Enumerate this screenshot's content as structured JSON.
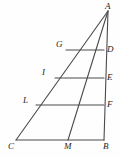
{
  "figure": {
    "kind": "geometry-diagram",
    "canvas": {
      "width": 121,
      "height": 158
    },
    "stroke_color": "#4a4a4a",
    "label_color": "#1d1d1d",
    "background_color": "#fefefe",
    "stroke_width": 1.1,
    "points": [
      {
        "id": "A",
        "label": "A",
        "x": 108,
        "y": 11,
        "label_x": 105,
        "label_y": 2,
        "role": "apex-vertex"
      },
      {
        "id": "B",
        "label": "B",
        "x": 104,
        "y": 140,
        "label_x": 103,
        "label_y": 142,
        "role": "base-right-vertex"
      },
      {
        "id": "C",
        "label": "C",
        "x": 16,
        "y": 140,
        "label_x": 8,
        "label_y": 142,
        "role": "base-left-vertex"
      },
      {
        "id": "M",
        "label": "M",
        "x": 68,
        "y": 140,
        "label_x": 64,
        "label_y": 142,
        "role": "base-point"
      },
      {
        "id": "D",
        "label": "D",
        "x": 104,
        "y": 50,
        "label_x": 107,
        "label_y": 45,
        "role": "right-edge-point"
      },
      {
        "id": "E",
        "label": "E",
        "x": 104,
        "y": 78,
        "label_x": 107,
        "label_y": 73,
        "role": "right-edge-point"
      },
      {
        "id": "F",
        "label": "F",
        "x": 104,
        "y": 105,
        "label_x": 107,
        "label_y": 100,
        "role": "right-edge-point"
      },
      {
        "id": "G",
        "label": "G",
        "x": 66,
        "y": 50,
        "label_x": 56,
        "label_y": 40,
        "role": "hypotenuse-point"
      },
      {
        "id": "I",
        "label": "I",
        "x": 55,
        "y": 78,
        "label_x": 42,
        "label_y": 68,
        "role": "hypotenuse-point"
      },
      {
        "id": "L",
        "label": "L",
        "x": 36,
        "y": 105,
        "label_x": 23,
        "label_y": 96,
        "role": "hypotenuse-point"
      }
    ],
    "segments": [
      {
        "id": "AB",
        "name": "segment-a-b",
        "from": "A",
        "to": "B"
      },
      {
        "id": "CB",
        "name": "segment-c-b",
        "from": "C",
        "to": "B"
      },
      {
        "id": "CA",
        "name": "segment-c-a",
        "from": "C",
        "to": "A"
      },
      {
        "id": "AM",
        "name": "cevian-a-m",
        "from": "A",
        "to": "M"
      },
      {
        "id": "GD",
        "name": "segment-g-d",
        "from": "G",
        "to": "D"
      },
      {
        "id": "IE",
        "name": "segment-i-e",
        "from": "I",
        "to": "E"
      },
      {
        "id": "LF",
        "name": "segment-l-f",
        "from": "L",
        "to": "F"
      }
    ]
  }
}
